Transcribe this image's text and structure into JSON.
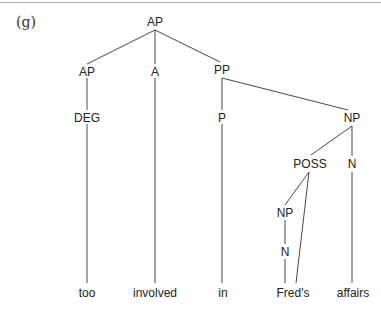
{
  "example_label": "(g)",
  "tree": {
    "nodes": {
      "root": "AP",
      "ap": "AP",
      "a": "A",
      "pp": "PP",
      "deg": "DEG",
      "p": "P",
      "np": "NP",
      "poss": "POSS",
      "n_head": "N",
      "np_inner": "NP",
      "n_inner": "N"
    },
    "leaves": {
      "too": "too",
      "involved": "involved",
      "in": "in",
      "freds": "Fred's",
      "affairs": "affairs"
    }
  }
}
